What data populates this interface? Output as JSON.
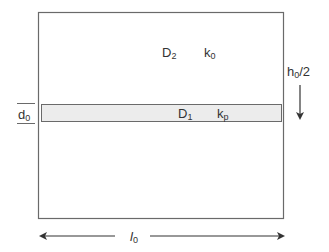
{
  "diagram": {
    "type": "layered-slab-schematic",
    "colors": {
      "stroke": "#6a6a6a",
      "band_fill": "#ececec",
      "background": "#ffffff",
      "text": "#333333",
      "arrow": "#333333"
    },
    "upper_region": {
      "diffusion": {
        "base": "D",
        "sub": "2"
      },
      "conductivity": {
        "base": "k",
        "sub": "0"
      }
    },
    "band_region": {
      "diffusion": {
        "base": "D",
        "sub": "1"
      },
      "conductivity": {
        "base": "k",
        "sub": "p"
      }
    },
    "band_thickness_label": {
      "base": "d",
      "sub": "0"
    },
    "half_height_label": {
      "base": "h",
      "sub": "0",
      "suffix": "/2"
    },
    "width_label": {
      "base": "l",
      "sub": "0"
    }
  }
}
